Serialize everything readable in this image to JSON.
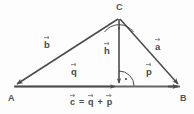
{
  "figure": {
    "kind": "vector-triangle-diagram",
    "colors": {
      "stroke": "#4a4a4a",
      "text": "#4a4a4a",
      "background": "#fdfdfd",
      "base_line": "#666666"
    },
    "vertices": [
      {
        "id": "A",
        "label": "A",
        "x": 14,
        "y": 86
      },
      {
        "id": "B",
        "label": "B",
        "x": 180,
        "y": 86
      },
      {
        "id": "C",
        "label": "C",
        "x": 119,
        "y": 18
      },
      {
        "id": "H",
        "label": "",
        "x": 119,
        "y": 86
      }
    ],
    "vectors": [
      {
        "id": "b",
        "label": "b",
        "from": "C",
        "to": "A",
        "label_x": 44,
        "label_y": 42
      },
      {
        "id": "a",
        "label": "a",
        "from": "C",
        "to": "B",
        "label_x": 155,
        "label_y": 44
      },
      {
        "id": "h",
        "label": "h",
        "from": "C",
        "to": "H",
        "label_x": 105,
        "label_y": 48
      },
      {
        "id": "q",
        "label": "q",
        "from": "A",
        "to": "H",
        "label_x": 72,
        "label_y": 69
      },
      {
        "id": "p",
        "label": "p",
        "from": "H",
        "to": "B",
        "label_x": 146,
        "label_y": 69
      },
      {
        "id": "c",
        "label": "c",
        "from": "A",
        "to": "B",
        "label_x": 0,
        "label_y": 0
      }
    ],
    "right_angles": [
      {
        "id": "angle-at-C",
        "at": "C",
        "marker": "arc-with-dot"
      },
      {
        "id": "angle-at-H",
        "at": "H",
        "marker": "arc-with-dot"
      }
    ],
    "equation": {
      "id": "vector-sum-equation",
      "text": "c = q + p",
      "lhs": "c",
      "operator_equals": "=",
      "term1": "q",
      "operator_plus": "+",
      "term2": "p"
    }
  }
}
